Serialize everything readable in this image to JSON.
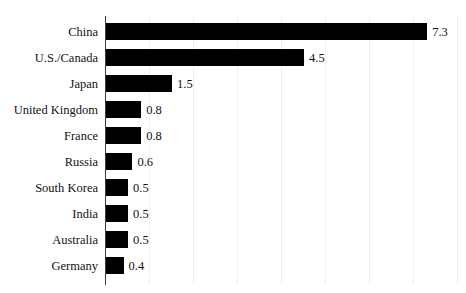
{
  "chart_data": {
    "type": "bar",
    "orientation": "horizontal",
    "title": "",
    "subtitle": "",
    "xlabel": "",
    "ylabel": "",
    "categories": [
      "China",
      "U.S./Canada",
      "Japan",
      "United Kingdom",
      "France",
      "Russia",
      "South Korea",
      "India",
      "Australia",
      "Germany"
    ],
    "values": [
      7.3,
      4.5,
      1.5,
      0.8,
      0.8,
      0.6,
      0.5,
      0.5,
      0.5,
      0.4
    ],
    "value_labels": [
      "7.3",
      "4.5",
      "1.5",
      "0.8",
      "0.8",
      "0.6",
      "0.5",
      "0.5",
      "0.5",
      "0.4"
    ],
    "xlim": [
      0,
      8
    ],
    "xticks": [
      1,
      2,
      3,
      4,
      5,
      6,
      7,
      8
    ],
    "xtick_labels": [],
    "ytick_labels": [
      "China",
      "U.S./Canada",
      "Japan",
      "United Kingdom",
      "France",
      "Russia",
      "South Korea",
      "India",
      "Australia",
      "Germany"
    ],
    "grid": true,
    "grid_axis": "x",
    "legend": null,
    "legend_position": "none",
    "annotations": [],
    "series": [
      {
        "name": "",
        "values": [
          7.3,
          4.5,
          1.5,
          0.8,
          0.8,
          0.6,
          0.5,
          0.5,
          0.5,
          0.4
        ]
      }
    ],
    "colors": {
      "bar": "#000000",
      "axis": "#3a3a3a",
      "grid": "#f0f0f0",
      "text": "#111111",
      "background": "#ffffff"
    }
  }
}
